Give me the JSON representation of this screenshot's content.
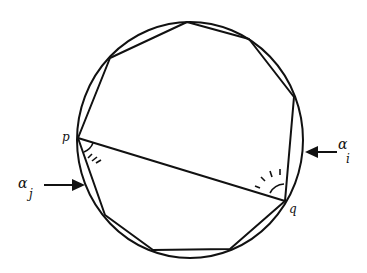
{
  "diagram": {
    "type": "polygon inscribed in circle",
    "circle": {
      "cx": 190,
      "cy": 140,
      "r": 117
    },
    "polygon_vertices": [
      [
        78,
        138
      ],
      [
        110,
        58
      ],
      [
        187,
        22
      ],
      [
        249,
        39
      ],
      [
        294,
        97
      ],
      [
        285,
        201
      ],
      [
        230,
        249
      ],
      [
        153,
        250
      ],
      [
        105,
        215
      ]
    ],
    "chord": {
      "from": "p",
      "to": "q"
    },
    "labels": {
      "p": "p",
      "q": "q",
      "alpha_i": "α",
      "alpha_i_sub": "i",
      "alpha_j": "α",
      "alpha_j_sub": "j"
    },
    "stroke_color": "#111111"
  }
}
